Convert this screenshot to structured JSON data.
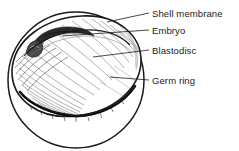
{
  "figure": {
    "style": "pen-and-ink line drawing with hatching",
    "background_color": "#ffffff",
    "ink_color": "#1a1a1a",
    "hatch_color": "#555555"
  },
  "labels": [
    {
      "id": "shell-membrane",
      "text": "Shell membrane",
      "text_x": 152,
      "text_y": 8,
      "leader": {
        "x1": 149,
        "y1": 13,
        "x2": 107,
        "y2": 22
      }
    },
    {
      "id": "embryo",
      "text": "Embryo",
      "text_x": 152,
      "text_y": 25,
      "leader": {
        "x1": 149,
        "y1": 30,
        "x2": 62,
        "y2": 36
      }
    },
    {
      "id": "blastodisc",
      "text": "Blastodisc",
      "text_x": 152,
      "text_y": 45,
      "leader": {
        "x1": 149,
        "y1": 50,
        "x2": 93,
        "y2": 57
      }
    },
    {
      "id": "germ-ring",
      "text": "Germ ring",
      "text_x": 152,
      "text_y": 75,
      "leader": {
        "x1": 149,
        "y1": 80,
        "x2": 110,
        "y2": 77
      }
    }
  ],
  "shapes": {
    "egg_outline": {
      "name": "egg-sphere-outline",
      "cx": 76,
      "cy": 80,
      "r": 68
    },
    "blastodisc": {
      "name": "blastodisc-dome",
      "description": "large tilted ellipse occupying the upper portion of the egg"
    },
    "embryo": {
      "name": "embryo-streak",
      "description": "dark elongated comma-shaped streak in the upper-left of the blastodisc"
    },
    "germ_ring": {
      "name": "germ-ring-band",
      "description": "dark thickened band along the lower rim of the blastodisc"
    }
  }
}
